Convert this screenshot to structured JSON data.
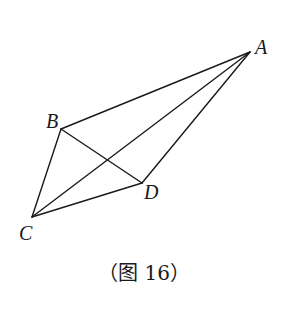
{
  "figure": {
    "caption": "（图 16）",
    "points": {
      "A": {
        "label": "A",
        "x": 250,
        "y": 52
      },
      "B": {
        "label": "B",
        "x": 61,
        "y": 129
      },
      "C": {
        "label": "C",
        "x": 32,
        "y": 217
      },
      "D": {
        "label": "D",
        "x": 142,
        "y": 183
      }
    },
    "segments": [
      "AB",
      "AC",
      "AD",
      "BC",
      "BD",
      "CD"
    ],
    "stroke_color": "#1a1a1a"
  }
}
